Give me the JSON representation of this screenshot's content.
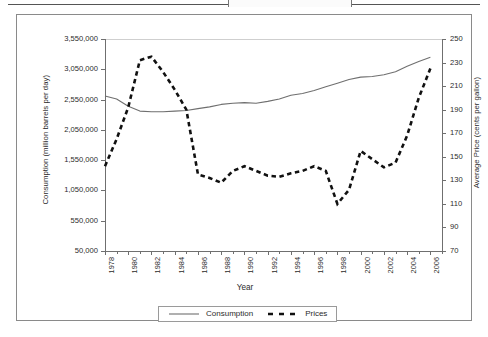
{
  "figure": {
    "caption_fragment": "Figure (cut off at top)",
    "xaxis_title": "Year",
    "yaxis_left_title": "Consumption (million barrels per day)",
    "yaxis_right_title": "Average Price (cents per gallon)"
  },
  "legend": {
    "items": [
      {
        "label": "Consumption",
        "style": "solid",
        "color": "#6f6f6f"
      },
      {
        "label": "Prices",
        "style": "dashed",
        "color": "#111111"
      }
    ]
  },
  "chart_data": {
    "type": "line",
    "title": "",
    "xlabel": "Year",
    "ylabel": "Consumption (million barrels per day)",
    "y2label": "Average Price (cents per gallon)",
    "grid": false,
    "legend_position": "bottom-center",
    "xlim": [
      1978,
      2007
    ],
    "ylim": [
      50000,
      3550000
    ],
    "y2lim": [
      70,
      250
    ],
    "ytick_labels": [
      "50,000",
      "550,000",
      "1,050,000",
      "1,550,000",
      "2,050,000",
      "2,550,000",
      "3,050,000",
      "3,550,000"
    ],
    "ytick_values": [
      50000,
      550000,
      1050000,
      1550000,
      2050000,
      2550000,
      3050000,
      3550000
    ],
    "y2tick_labels": [
      "70",
      "90",
      "110",
      "130",
      "150",
      "170",
      "190",
      "210",
      "230",
      "250"
    ],
    "y2tick_values": [
      70,
      90,
      110,
      130,
      150,
      170,
      190,
      210,
      230,
      250
    ],
    "xtick_labels": [
      "1978",
      "1980",
      "1982",
      "1984",
      "1986",
      "1988",
      "1990",
      "1992",
      "1994",
      "1996",
      "1998",
      "2000",
      "2002",
      "2004",
      "2006"
    ],
    "xtick_values": [
      1978,
      1980,
      1982,
      1984,
      1986,
      1988,
      1990,
      1992,
      1994,
      1996,
      1998,
      2000,
      2002,
      2004,
      2006
    ],
    "x": [
      1978,
      1979,
      1980,
      1981,
      1982,
      1983,
      1984,
      1985,
      1986,
      1987,
      1988,
      1989,
      1990,
      1991,
      1992,
      1993,
      1994,
      1995,
      1996,
      1997,
      1998,
      1999,
      2000,
      2001,
      2002,
      2003,
      2004,
      2005,
      2006
    ],
    "series": [
      {
        "name": "Consumption",
        "axis": "left",
        "style": "solid",
        "color": "#6f6f6f",
        "values": [
          2610000,
          2560000,
          2440000,
          2360000,
          2350000,
          2350000,
          2360000,
          2370000,
          2400000,
          2430000,
          2470000,
          2490000,
          2500000,
          2490000,
          2520000,
          2560000,
          2620000,
          2650000,
          2700000,
          2760000,
          2820000,
          2880000,
          2920000,
          2930000,
          2960000,
          3010000,
          3100000,
          3180000,
          3250000
        ]
      },
      {
        "name": "Prices",
        "axis": "right",
        "style": "dashed",
        "color": "#111111",
        "values": [
          142,
          165,
          192,
          232,
          235,
          222,
          207,
          190,
          135,
          132,
          128,
          138,
          142,
          138,
          134,
          133,
          136,
          138,
          142,
          138,
          110,
          122,
          155,
          148,
          141,
          145,
          168,
          200,
          225
        ]
      }
    ]
  }
}
